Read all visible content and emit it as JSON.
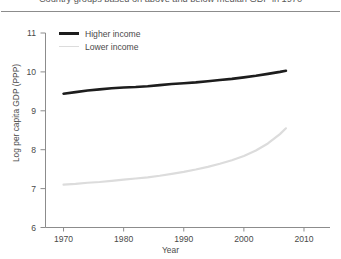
{
  "chart_data": {
    "type": "line",
    "title": "Country groups based on above and below median GDP in 1970",
    "xlabel": "Year",
    "ylabel": "Log per capita GDP (PPP)",
    "xlim": [
      1967,
      2011
    ],
    "ylim": [
      6,
      11
    ],
    "xticks": [
      1970,
      1980,
      1990,
      2000,
      2010
    ],
    "xtick_labels": [
      "1970",
      "1980",
      "1990",
      "2000",
      "2010"
    ],
    "yticks": [
      6,
      7,
      8,
      9,
      10,
      11
    ],
    "ytick_labels": [
      "6",
      "7",
      "8",
      "9",
      "10",
      "11"
    ],
    "grid": false,
    "legend_position": "upper-left",
    "series": [
      {
        "name": "Higher income",
        "color": "#1d1d1d",
        "width": 2.6,
        "x": [
          1970,
          1972,
          1974,
          1976,
          1978,
          1980,
          1982,
          1984,
          1986,
          1988,
          1990,
          1992,
          1994,
          1996,
          1998,
          2000,
          2002,
          2004,
          2006,
          2007
        ],
        "values": [
          9.44,
          9.48,
          9.52,
          9.55,
          9.58,
          9.6,
          9.61,
          9.63,
          9.66,
          9.69,
          9.71,
          9.73,
          9.76,
          9.79,
          9.82,
          9.86,
          9.9,
          9.95,
          10.0,
          10.03
        ]
      },
      {
        "name": "Lower income",
        "color": "#dcdcdc",
        "width": 2.2,
        "x": [
          1970,
          1972,
          1974,
          1976,
          1978,
          1980,
          1982,
          1984,
          1986,
          1988,
          1990,
          1992,
          1994,
          1996,
          1998,
          2000,
          2002,
          2004,
          2006,
          2007
        ],
        "values": [
          7.1,
          7.12,
          7.15,
          7.17,
          7.2,
          7.23,
          7.26,
          7.29,
          7.33,
          7.38,
          7.43,
          7.49,
          7.56,
          7.64,
          7.73,
          7.84,
          7.98,
          8.16,
          8.4,
          8.55
        ]
      }
    ]
  },
  "legend": {
    "items": [
      {
        "label": "Higher income"
      },
      {
        "label": "Lower income"
      }
    ]
  }
}
